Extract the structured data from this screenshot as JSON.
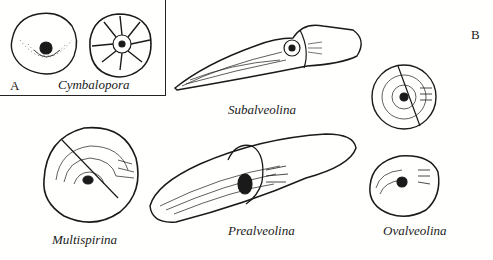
{
  "figure": {
    "panels": [
      {
        "id": "A",
        "label": "A"
      },
      {
        "id": "B",
        "label": "B"
      }
    ],
    "specimens": [
      {
        "name": "Cymbalopora",
        "panel": "A",
        "views": 2
      },
      {
        "name": "Subalveolina",
        "panel": "B"
      },
      {
        "name": "Multispirina",
        "panel": "B"
      },
      {
        "name": "Prealveolina",
        "panel": "B"
      },
      {
        "name": "Ovalveolina",
        "panel": "B",
        "views": 2
      }
    ],
    "colors": {
      "ink": "#1a1a1a",
      "paper": "#fffffe"
    }
  }
}
